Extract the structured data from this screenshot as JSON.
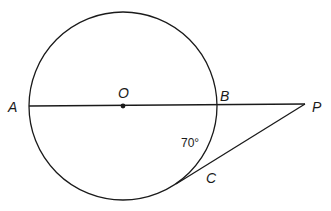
{
  "diagram": {
    "type": "geometry",
    "stroke_color": "#1a1a1a",
    "circle": {
      "center": "O",
      "cx": 123,
      "cy": 106,
      "r": 94
    },
    "points": {
      "A": {
        "label": "A",
        "x": 29,
        "y": 106
      },
      "O": {
        "label": "O",
        "x": 123,
        "y": 106
      },
      "B": {
        "label": "B",
        "x": 217,
        "y": 106
      },
      "P": {
        "label": "P",
        "x": 305,
        "y": 104
      },
      "C": {
        "label": "C",
        "x": 180,
        "y": 181
      }
    },
    "segments": [
      {
        "from": "A",
        "to": "P",
        "name": "secant-through-diameter"
      },
      {
        "from": "C",
        "to": "P",
        "name": "tangent-segment"
      }
    ],
    "angle_annotation": {
      "label": "70°",
      "arc": "BC"
    }
  }
}
